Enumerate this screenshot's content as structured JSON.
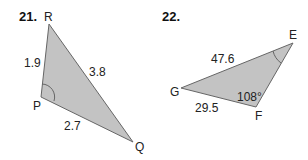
{
  "problems": [
    {
      "number": "21.",
      "vertices": {
        "R": "R",
        "P": "P",
        "Q": "Q"
      },
      "sides": {
        "RP": "1.9",
        "RQ": "3.8",
        "PQ": "2.7"
      },
      "marked_angle": "P"
    },
    {
      "number": "22.",
      "vertices": {
        "E": "E",
        "G": "G",
        "F": "F"
      },
      "sides": {
        "GE": "47.6",
        "GF": "29.5"
      },
      "angle_F": "108°",
      "marked_angle": "E"
    }
  ],
  "colors": {
    "fill": "#c3c3c3",
    "stroke": "#666666"
  }
}
